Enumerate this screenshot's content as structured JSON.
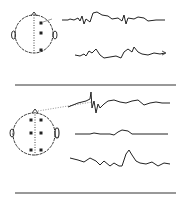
{
  "figure": {
    "ink_color": "#222222",
    "divider_color": "#333333",
    "panels": [
      {
        "id": "top",
        "head": {
          "cx": 34,
          "cy": 34,
          "r": 19,
          "electrodes": [
            [
              41,
              23
            ],
            [
              41,
              33
            ],
            [
              41,
              50
            ]
          ]
        },
        "traces": [
          {
            "points": "62,20 68,20 70,19 74,20 78,18 80,21 82,16 84,24 86,19 90,22 93,13 97,12 102,15 108,16 112,19 118,18 122,21 124,15 126,24 128,18 134,19 138,17 144,18 148,21 156,20 165,20"
          },
          {
            "points": "75,55 80,56 84,54 86,56 89,51 92,53 96,49 100,55 104,58 110,57 116,56 121,58 124,52 128,49 132,52 134,47 138,52 142,54 148,55 154,53 160,54 165,53"
          }
        ]
      },
      {
        "id": "bottom",
        "head": {
          "cx": 34,
          "cy": 134,
          "r": 21,
          "electrodes": [
            [
              31,
              120
            ],
            [
              41,
              120
            ],
            [
              31,
              133
            ],
            [
              41,
              133
            ],
            [
              31,
              150
            ],
            [
              41,
              150
            ]
          ]
        },
        "connector": {
          "from": [
            38,
            111
          ],
          "to": [
            92,
            102
          ]
        },
        "traces": [
          {
            "points": "68,107 78,103 86,101 90,99 91,92 92,108 94,101 96,113 98,104 100,108 104,104 108,101 114,100 120,102 126,103 132,101 138,100 144,105 150,103 156,102 162,103 170,103"
          },
          {
            "points": "75,134 90,134 94,133 100,134 110,134 114,135 118,132 122,130 128,131 132,134 140,134 150,134 160,134 168,134"
          },
          {
            "points": "70,158 78,160 84,162 90,158 96,161 100,165 104,161 110,166 114,163 119,166 122,166 126,154 129,150 132,155 136,161 140,163 146,164 152,162 158,166 164,163 170,164"
          }
        ]
      }
    ],
    "dividers": [
      {
        "x1": 15,
        "x2": 176,
        "y": 85
      },
      {
        "x1": 15,
        "x2": 176,
        "y": 193
      }
    ]
  }
}
